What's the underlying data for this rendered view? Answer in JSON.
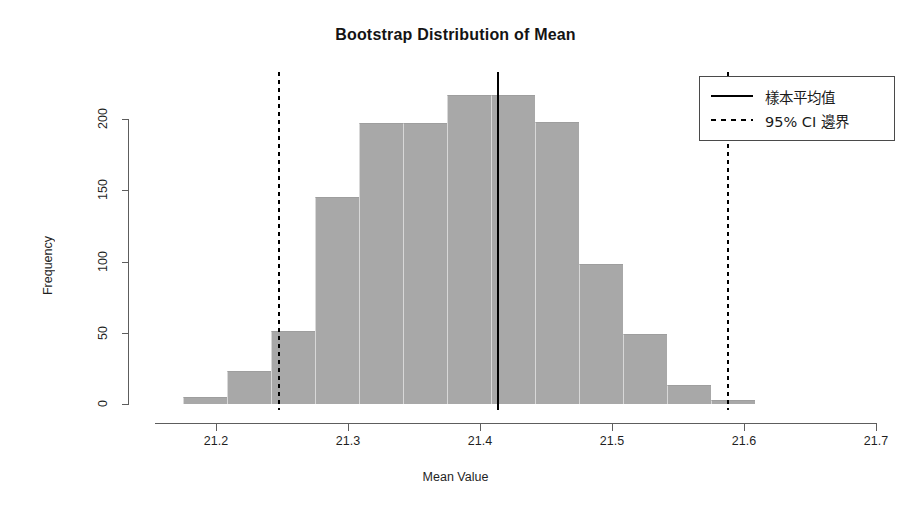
{
  "chart_data": {
    "type": "bar",
    "title": "Bootstrap Distribution of Mean",
    "xlabel": "Mean Value",
    "ylabel": "Frequency",
    "xlim": [
      21.155,
      21.702
    ],
    "ylim": [
      0,
      228
    ],
    "grid": false,
    "bar_color": "#a8a8a8",
    "bin_width": 0.0333,
    "bin_centers": [
      21.172,
      21.205,
      21.239,
      21.272,
      21.305,
      21.339,
      21.372,
      21.405,
      21.439,
      21.472,
      21.505,
      21.539,
      21.572,
      21.605,
      21.639,
      21.672
    ],
    "bin_edges": [
      21.155,
      21.188,
      21.222,
      21.255,
      21.288,
      21.322,
      21.355,
      21.388,
      21.422,
      21.455,
      21.488,
      21.522,
      21.555,
      21.588,
      21.622,
      21.655,
      21.689
    ],
    "values": [
      5,
      23,
      51,
      145,
      197,
      197,
      217,
      198,
      198,
      98,
      49,
      13,
      3
    ],
    "bars": [
      {
        "x0": 21.175,
        "x1": 21.208,
        "count": 5
      },
      {
        "x0": 21.208,
        "x1": 21.242,
        "count": 23
      },
      {
        "x0": 21.242,
        "x1": 21.275,
        "count": 51
      },
      {
        "x0": 21.275,
        "x1": 21.308,
        "count": 145
      },
      {
        "x0": 21.308,
        "x1": 21.342,
        "count": 197
      },
      {
        "x0": 21.342,
        "x1": 21.375,
        "count": 197
      },
      {
        "x0": 21.375,
        "x1": 21.408,
        "count": 217
      },
      {
        "x0": 21.408,
        "x1": 21.442,
        "count": 217
      },
      {
        "x0": 21.442,
        "x1": 21.475,
        "count": 198
      },
      {
        "x0": 21.475,
        "x1": 21.508,
        "count": 98
      },
      {
        "x0": 21.508,
        "x1": 21.542,
        "count": 49
      },
      {
        "x0": 21.542,
        "x1": 21.575,
        "count": 13
      },
      {
        "x0": 21.575,
        "x1": 21.608,
        "count": 3
      }
    ],
    "xticks": [
      21.2,
      21.3,
      21.4,
      21.5,
      21.6,
      21.7
    ],
    "xtick_labels": [
      "21.2",
      "21.3",
      "21.4",
      "21.5",
      "21.6",
      "21.7"
    ],
    "yticks": [
      0,
      50,
      100,
      150,
      200
    ],
    "ytick_labels": [
      "0",
      "50",
      "100",
      "150",
      "200"
    ],
    "reference_lines": [
      {
        "name": "sample-mean",
        "value": 21.414,
        "style": "solid",
        "color": "#000000"
      },
      {
        "name": "ci-lower",
        "value": 21.248,
        "style": "dashed",
        "color": "#000000"
      },
      {
        "name": "ci-upper",
        "value": 21.588,
        "style": "dashed",
        "color": "#000000"
      }
    ],
    "legend": {
      "position": "top-right",
      "entries": [
        {
          "label": "樣本平均值",
          "style": "solid"
        },
        {
          "label": "95% CI 邊界",
          "style": "dashed"
        }
      ]
    }
  }
}
